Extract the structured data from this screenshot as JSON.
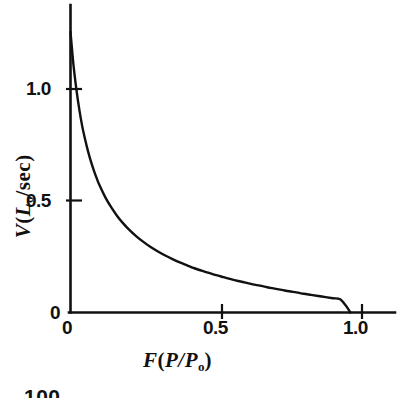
{
  "figure": {
    "page_number": "100",
    "background_color": "#ffffff",
    "ink_color": "#111111"
  },
  "chart_data": {
    "type": "line",
    "title": "",
    "subtitle": "",
    "xlabel": "F ( P/P0 )",
    "xlabel_parts": {
      "symbol": "F",
      "open": "(",
      "numerator": "P",
      "slash": "/",
      "denominator": "P",
      "denominator_sub": "o",
      "close": ")"
    },
    "ylabel": "V ( L0/sec )",
    "ylabel_parts": {
      "symbol": "V",
      "open": "(",
      "unit_symbol": "L",
      "unit_sub": "o",
      "per": "/sec",
      "close": ")"
    },
    "xlim": [
      0,
      1.15
    ],
    "ylim": [
      0,
      1.32
    ],
    "xticks": [
      0,
      0.5,
      1.0
    ],
    "xticklabels": [
      "0",
      "0.5",
      "1.0"
    ],
    "yticks": [
      0,
      0.5,
      1.0
    ],
    "yticklabels": [
      "0",
      "0.5",
      "1.0"
    ],
    "grid": false,
    "legend": null,
    "legend_position": "none",
    "annotations": [],
    "series": [
      {
        "name": "force-velocity (Hill hyperbola)",
        "color": "#111111",
        "linewidth": 2.4,
        "x": [
          0.0,
          0.01,
          0.02,
          0.03,
          0.04,
          0.05,
          0.06,
          0.07,
          0.08,
          0.09,
          0.1,
          0.12,
          0.14,
          0.16,
          0.18,
          0.2,
          0.225,
          0.25,
          0.275,
          0.3,
          0.325,
          0.35,
          0.375,
          0.4,
          0.425,
          0.45,
          0.475,
          0.5,
          0.525,
          0.55,
          0.575,
          0.6,
          0.625,
          0.65,
          0.675,
          0.7,
          0.725,
          0.75,
          0.775,
          0.8,
          0.825,
          0.85,
          0.875,
          0.9,
          0.925,
          0.945,
          0.96
        ],
        "y": [
          1.255,
          1.11,
          1.0,
          0.91,
          0.835,
          0.775,
          0.722,
          0.676,
          0.636,
          0.6,
          0.568,
          0.514,
          0.47,
          0.432,
          0.4,
          0.372,
          0.342,
          0.316,
          0.293,
          0.273,
          0.255,
          0.239,
          0.224,
          0.211,
          0.198,
          0.187,
          0.177,
          0.167,
          0.158,
          0.149,
          0.141,
          0.134,
          0.126,
          0.12,
          0.113,
          0.107,
          0.101,
          0.095,
          0.09,
          0.084,
          0.079,
          0.074,
          0.069,
          0.064,
          0.059,
          0.03,
          0.0
        ]
      }
    ]
  }
}
